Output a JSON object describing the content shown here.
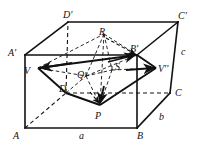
{
  "figure": {
    "kind": "geometry-diagram",
    "stroke_color": "#111111",
    "background_color": "#ffffff",
    "labels": [
      {
        "id": "D-prime",
        "text": "D'",
        "x": 63,
        "y": 10,
        "size": "normal"
      },
      {
        "id": "C-prime",
        "text": "C'",
        "x": 178,
        "y": 11,
        "size": "normal"
      },
      {
        "id": "A-prime",
        "text": "A'",
        "x": 8,
        "y": 48,
        "size": "normal"
      },
      {
        "id": "R",
        "text": "R",
        "x": 99,
        "y": 27,
        "size": "normal"
      },
      {
        "id": "B-prime",
        "text": "B'",
        "x": 130,
        "y": 44,
        "size": "normal"
      },
      {
        "id": "c",
        "text": "c",
        "x": 181,
        "y": 47,
        "size": "normal"
      },
      {
        "id": "V",
        "text": "V",
        "x": 24,
        "y": 66,
        "size": "normal"
      },
      {
        "id": "S",
        "text": "S",
        "x": 115,
        "y": 62,
        "size": "normal"
      },
      {
        "id": "V-dprime",
        "text": "V''",
        "x": 158,
        "y": 64,
        "size": "normal"
      },
      {
        "id": "Q",
        "text": "Q",
        "x": 77,
        "y": 70,
        "size": "normal"
      },
      {
        "id": "D",
        "text": "D",
        "x": 59,
        "y": 84,
        "size": "normal"
      },
      {
        "id": "C",
        "text": "C",
        "x": 175,
        "y": 88,
        "size": "normal"
      },
      {
        "id": "P",
        "text": "P",
        "x": 95,
        "y": 111,
        "size": "normal"
      },
      {
        "id": "b",
        "text": "b",
        "x": 159,
        "y": 112,
        "size": "normal"
      },
      {
        "id": "A",
        "text": "A",
        "x": 13,
        "y": 131,
        "size": "normal"
      },
      {
        "id": "a",
        "text": "a",
        "x": 79,
        "y": 131,
        "size": "normal"
      },
      {
        "id": "B",
        "text": "B",
        "x": 137,
        "y": 131,
        "size": "normal"
      }
    ],
    "vertices": {
      "A": [
        25,
        128
      ],
      "B": [
        137,
        128
      ],
      "C": [
        170,
        93
      ],
      "D": [
        66,
        93
      ],
      "Ap": [
        25,
        55
      ],
      "Bp": [
        137,
        55
      ],
      "Cp": [
        178,
        22
      ],
      "Dp": [
        68,
        22
      ]
    },
    "cross_section_points": {
      "V": [
        38,
        68
      ],
      "R": [
        104,
        34
      ],
      "Vpp": [
        156,
        68
      ],
      "P": [
        100,
        105
      ],
      "Dc": [
        66,
        93
      ],
      "Q": [
        86,
        76
      ],
      "S": [
        112,
        70
      ],
      "Bp": [
        137,
        55
      ]
    },
    "edges_solid": [
      {
        "name": "edge-A-B",
        "from": "A",
        "to": "B"
      },
      {
        "name": "edge-B-C",
        "from": "B",
        "to": "C"
      },
      {
        "name": "edge-A-Aprime",
        "from": "A",
        "to": "Ap"
      },
      {
        "name": "edge-B-Bprime",
        "from": "B",
        "to": "Bp"
      },
      {
        "name": "edge-C-Cprime",
        "from": "C",
        "to": "Cp"
      },
      {
        "name": "edge-Aprime-Bprime",
        "from": "Ap",
        "to": "Bp"
      },
      {
        "name": "edge-Bprime-Cprime",
        "from": "Bp",
        "to": "Cp"
      },
      {
        "name": "edge-Aprime-Dprime",
        "from": "Ap",
        "to": "Dp"
      },
      {
        "name": "edge-Dprime-Cprime",
        "from": "Dp",
        "to": "Cp"
      }
    ],
    "edges_dashed": [
      {
        "name": "edge-A-D-hidden",
        "from": "A",
        "to": "D"
      },
      {
        "name": "edge-D-C-hidden",
        "from": "D",
        "to": "C"
      },
      {
        "name": "edge-D-Dprime-hidden",
        "from": "D",
        "to": "Dp"
      }
    ]
  }
}
